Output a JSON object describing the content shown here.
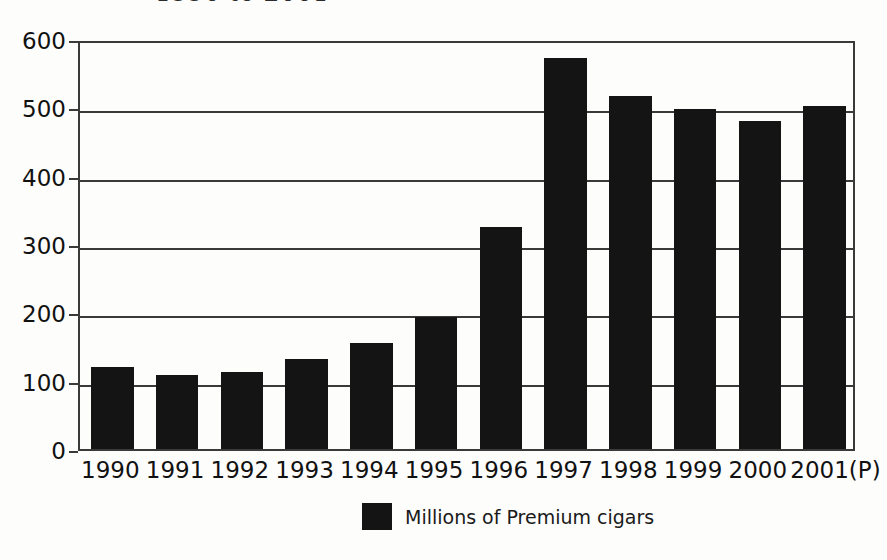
{
  "chart_data": {
    "type": "bar",
    "title": "1990 to 2001",
    "xlabel": "",
    "ylabel": "",
    "ylim": [
      0,
      600
    ],
    "yticks": [
      0,
      100,
      200,
      300,
      400,
      500,
      600
    ],
    "grid": true,
    "legend_position": "bottom-center",
    "bar_color": "#141414",
    "categories": [
      "1990",
      "1991",
      "1992",
      "1993",
      "1994",
      "1995",
      "1996",
      "1997",
      "1998",
      "1999",
      "2000",
      "2001(P)"
    ],
    "series": [
      {
        "name": "Millions of Premium cigars",
        "values": [
          120,
          108,
          113,
          131,
          155,
          193,
          325,
          572,
          516,
          498,
          480,
          502
        ]
      }
    ]
  }
}
